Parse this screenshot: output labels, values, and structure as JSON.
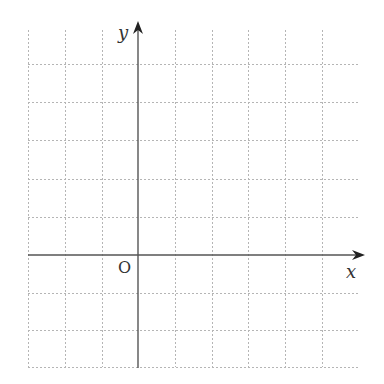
{
  "diagram": {
    "type": "coordinate-plane",
    "axes": {
      "x_label": "x",
      "y_label": "y",
      "origin_label": "O",
      "axis_color": "#555555",
      "x_axis_y": 255,
      "y_axis_x": 138,
      "x_axis_start": 28,
      "x_axis_end": 365,
      "y_axis_top": 21,
      "y_axis_bottom": 368
    },
    "grid": {
      "color": "#b5b5b5",
      "dash": "2,2",
      "left": 28,
      "right": 358,
      "top": 30,
      "bottom": 367,
      "vertical_lines": [
        28,
        65,
        102,
        138,
        175,
        212,
        248,
        285,
        322
      ],
      "horizontal_lines": [
        64,
        102,
        140,
        179,
        217,
        255,
        293,
        330,
        367
      ]
    },
    "labels": {
      "x": {
        "text": "x",
        "left": 346,
        "top": 263
      },
      "y": {
        "text": "y",
        "left": 118,
        "top": 24
      },
      "origin": {
        "text": "O",
        "left": 118,
        "top": 260
      }
    }
  }
}
